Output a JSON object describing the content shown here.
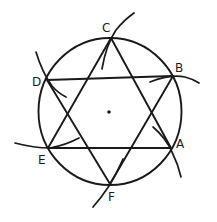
{
  "figure": {
    "vertices": [
      {
        "id": "A",
        "label": "A"
      },
      {
        "id": "B",
        "label": "B"
      },
      {
        "id": "C",
        "label": "C"
      },
      {
        "id": "D",
        "label": "D"
      },
      {
        "id": "E",
        "label": "E"
      },
      {
        "id": "F",
        "label": "F"
      }
    ],
    "triangles": [
      {
        "name": "triangle-ace",
        "vertices": [
          "A",
          "C",
          "E"
        ]
      },
      {
        "name": "triangle-bdf",
        "vertices": [
          "B",
          "D",
          "F"
        ]
      }
    ],
    "chords": [
      {
        "from": "D",
        "to": "B"
      },
      {
        "from": "E",
        "to": "A"
      }
    ],
    "center_marked": true,
    "construction_arcs": [
      "C",
      "B",
      "A",
      "F",
      "E",
      "D"
    ],
    "colors": {
      "ink": "#1a1a1a",
      "background": "#ffffff"
    }
  }
}
